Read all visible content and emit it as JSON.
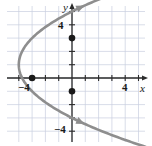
{
  "figure": {
    "kind": "coordinate-plane-graph",
    "background": "#ffffff",
    "grid_color": "#c9cfe0",
    "axis_color": "#2b2b2b",
    "curve_color": "#8e8e8e",
    "point_color": "#1a1a1a"
  },
  "axis_labels": {
    "x": "x",
    "y": "y"
  },
  "tick_labels": {
    "x_neg": "−4",
    "x_pos": "4",
    "y_pos": "4",
    "y_neg": "−4"
  },
  "chart_data": {
    "type": "line",
    "title": "",
    "xlabel": "x",
    "ylabel": "y",
    "xlim": [
      -5.5,
      5.5
    ],
    "ylim": [
      -5.5,
      5.5
    ],
    "grid": true,
    "legend": "none",
    "xticks": [
      -5,
      -4,
      -3,
      -2,
      -1,
      0,
      1,
      2,
      3,
      4,
      5
    ],
    "yticks": [
      -5,
      -4,
      -3,
      -2,
      -1,
      0,
      1,
      2,
      3,
      4,
      5
    ],
    "xtick_labels_shown": [
      "−4",
      "4"
    ],
    "ytick_labels_shown": [
      "4",
      "−4"
    ],
    "series": [
      {
        "name": "sideways parabola opening right",
        "equation": "x = (1/4)(y - 1)^2 - 4",
        "vertex": [
          -4,
          1
        ],
        "orientation": "opens-right",
        "arrowheads": [
          "upper-right",
          "lower-right"
        ],
        "x": [
          -4.0,
          -3.9,
          -3.75,
          -3.5,
          -3.0,
          -2.4,
          -1.6,
          -0.6,
          0.0,
          0.8,
          2.0,
          3.4,
          5.2
        ],
        "y_upper": [
          1.0,
          1.63,
          2.0,
          2.41,
          3.0,
          3.53,
          4.1,
          4.69,
          5.0,
          5.38,
          5.9,
          6.44,
          7.1
        ],
        "y_lower": [
          1.0,
          0.37,
          0.0,
          -0.41,
          -1.0,
          -1.53,
          -2.1,
          -2.69,
          -3.0,
          -3.38,
          -3.9,
          -4.44,
          -5.1
        ]
      }
    ],
    "points": [
      {
        "label": "",
        "x": -3.0,
        "y": 0.0
      },
      {
        "label": "",
        "x": 0.0,
        "y": 3.0
      },
      {
        "label": "",
        "x": 0.0,
        "y": -1.0
      }
    ]
  }
}
